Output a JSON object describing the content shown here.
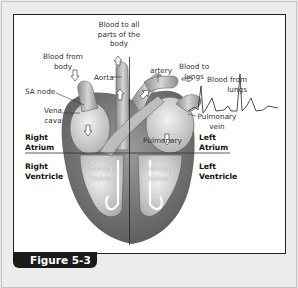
{
  "figure": {
    "caption": "Figure 5-3",
    "accent_color": "#1a1a1a",
    "labels": {
      "blood_to_all_parts_l1": "Blood to all",
      "blood_to_all_parts_l2": "parts of the",
      "blood_to_all_parts_l3": "body",
      "blood_from_body_l1": "Blood from",
      "blood_from_body_l2": "body",
      "aorta": "Aorta",
      "sa_node": "SA node",
      "vena_cava_l1": "Vena",
      "vena_cava_l2": "cava",
      "artery": "artery",
      "blood_to_lungs_l1": "Blood to",
      "blood_to_lungs_l2": "lungs",
      "blood_from_lungs_l1": "Blood from",
      "blood_from_lungs_l2": "lungs",
      "pulmonary_vein_l1": "Pulmonary",
      "pulmonary_vein_l2": "vein",
      "pulmonary": "Pulmonary",
      "right_atrium_l1": "Right",
      "right_atrium_l2": "Atrium",
      "left_atrium_l1": "Left",
      "left_atrium_l2": "Atrium",
      "right_ventricle_l1": "Right",
      "right_ventricle_l2": "Ventricle",
      "left_ventricle_l1": "Left",
      "left_ventricle_l2": "Ventricle",
      "valve_left_l1": "One-way",
      "valve_left_l2": "Valve",
      "valve_right_l1": "One-way",
      "valve_right_l2": "Valve"
    }
  }
}
